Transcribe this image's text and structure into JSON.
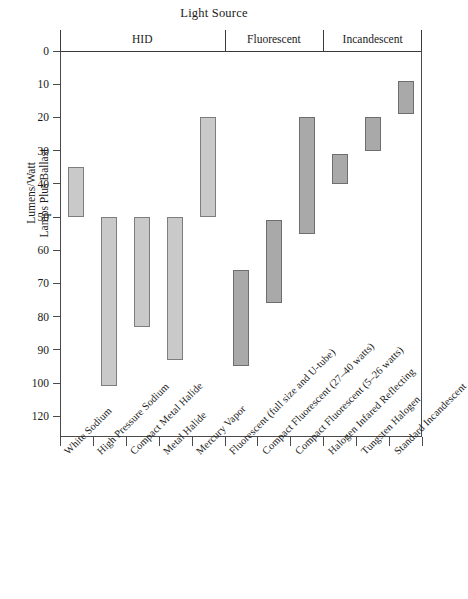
{
  "chart_data": {
    "type": "bar",
    "title": "Light Source",
    "subtitle": "",
    "xlabel": "",
    "ylabel": "Lumens/Watt\nLamps Plus Ballast",
    "ylabel_lines": [
      "Lumens/Watt",
      "Lamps Plus Ballast"
    ],
    "orientation": "vertical-range",
    "y_inverted": true,
    "ylim": [
      0,
      125
    ],
    "yticks": [
      0,
      10,
      20,
      30,
      40,
      50,
      60,
      70,
      80,
      90,
      100,
      120
    ],
    "ytick_labels": [
      "0",
      "10",
      "20",
      "30",
      "40",
      "50",
      "60",
      "70",
      "80",
      "90",
      "100",
      "120"
    ],
    "grid": false,
    "legend": "none",
    "categories": [
      "White Sodium",
      "High Pressure Sodium",
      "Compact Metal Halide",
      "Metal Halide",
      "Mercury Vapor",
      "Fluorescent (full size and U-tube)",
      "Compact Fluorescent (27–40 watts)",
      "Compact Fluorescent (5–26 watts)",
      "Halogen Infared Reflecting",
      "Tungsten Halogen",
      "Standard Incandescent"
    ],
    "series": [
      {
        "name": "Efficacy range (lumens/watt)",
        "type": "range",
        "low": [
          35,
          50,
          50,
          50,
          20,
          66,
          51,
          20,
          31,
          20,
          9
        ],
        "high": [
          50,
          102,
          83,
          93,
          50,
          95,
          76,
          55,
          40,
          30,
          19
        ]
      }
    ],
    "groups": [
      {
        "label": "HID",
        "categories": 5,
        "color": "#c9c9c9"
      },
      {
        "label": "Fluorescent",
        "categories": 3,
        "color": "#a9a9a9"
      },
      {
        "label": "Incandescent",
        "categories": 3,
        "color": "#a9a9a9"
      }
    ],
    "bar_fill_light": "#c9c9c9",
    "bar_fill_dark": "#a9a9a9",
    "bar_border": "#7d7d7d",
    "axis_color": "#4a4a4a"
  }
}
